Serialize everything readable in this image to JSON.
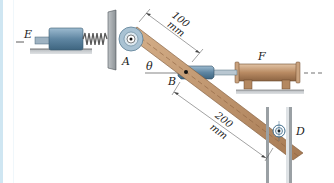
{
  "figure": {
    "labels": {
      "E": "E",
      "A": "A",
      "B": "B",
      "F": "F",
      "D": "D",
      "theta": "θ"
    },
    "dimensions": {
      "AB_value": "100",
      "AB_unit": "mm",
      "BD_value": "200",
      "BD_unit": "mm"
    },
    "colors": {
      "link": "#b98a63",
      "cylinder_blue": "#6f93ad",
      "cylinder_tan": "#c19a78",
      "ground": "#8a8f94",
      "frame_border": "#cfe6f2"
    }
  }
}
